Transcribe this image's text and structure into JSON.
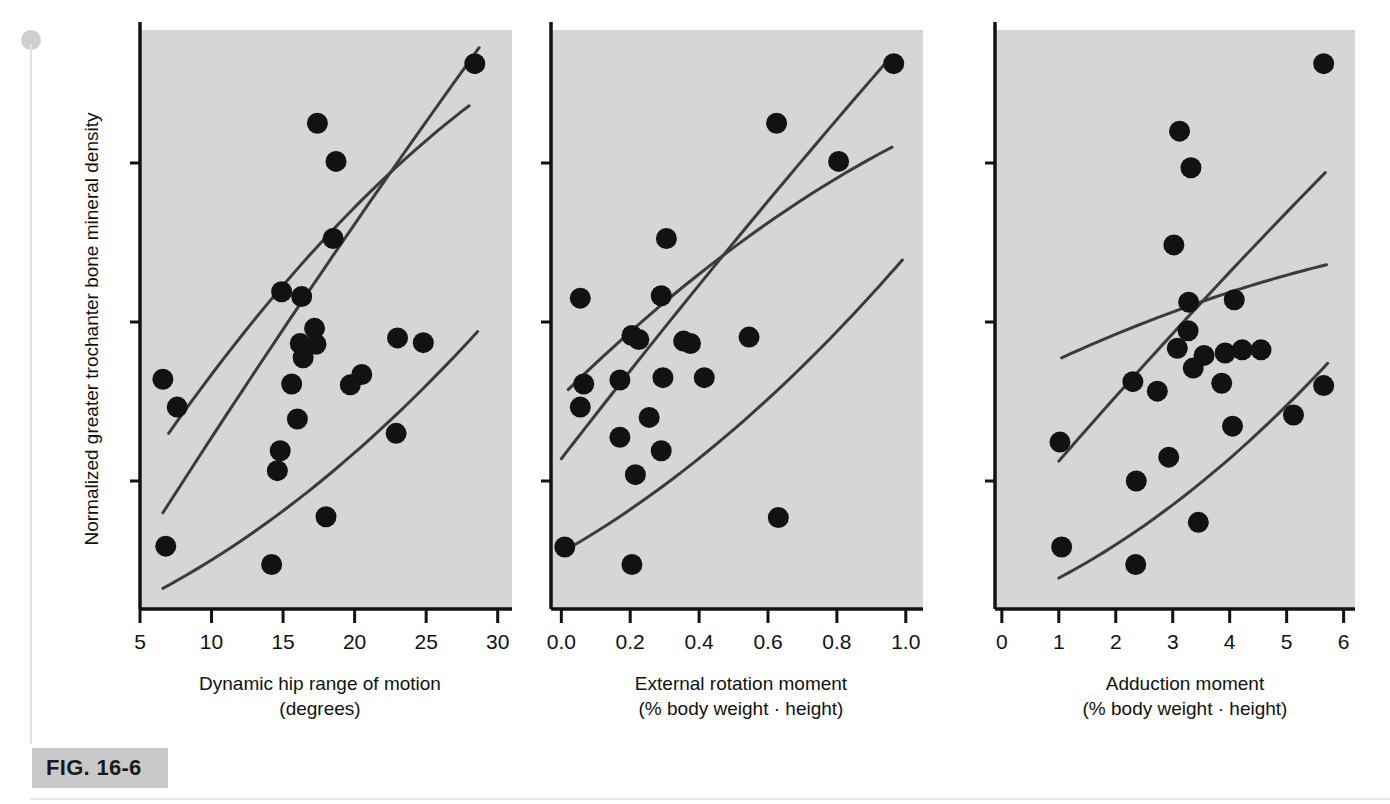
{
  "figure": {
    "id_label": "FIG. 16-6",
    "y_axis_label": "Normalized greater trochanter bone mineral density",
    "marker_color": "#121212",
    "line_color": "#3b3b3b",
    "plot_background": "#d6d6d6",
    "axis_color": "#121212",
    "chip_color": "#c9c9c9"
  },
  "chart_data": [
    {
      "type": "scatter",
      "panel": 1,
      "title": "",
      "xlabel": "Dynamic hip range of motion",
      "xlabel_units": "(degrees)",
      "ylabel": "Normalized greater trochanter bone mineral density",
      "xlim": [
        5,
        31
      ],
      "ylim": [
        -3.6,
        3.6
      ],
      "xticks": [
        5,
        10,
        15,
        20,
        25,
        30
      ],
      "xticklabels": [
        "5",
        "10",
        "15",
        "20",
        "25",
        "30"
      ],
      "yticks": [
        2,
        0,
        -2
      ],
      "yticklabels": [
        "2",
        "0",
        "-2"
      ],
      "grid": false,
      "legend": "none",
      "points": [
        {
          "x": 28.4,
          "y": 3.25
        },
        {
          "x": 17.4,
          "y": 2.5
        },
        {
          "x": 18.7,
          "y": 2.02
        },
        {
          "x": 18.5,
          "y": 1.05
        },
        {
          "x": 14.9,
          "y": 0.38
        },
        {
          "x": 16.3,
          "y": 0.32
        },
        {
          "x": 17.2,
          "y": -0.08
        },
        {
          "x": 16.2,
          "y": -0.27
        },
        {
          "x": 17.3,
          "y": -0.28
        },
        {
          "x": 16.4,
          "y": -0.45
        },
        {
          "x": 23.0,
          "y": -0.2
        },
        {
          "x": 24.8,
          "y": -0.26
        },
        {
          "x": 6.6,
          "y": -0.72
        },
        {
          "x": 15.6,
          "y": -0.78
        },
        {
          "x": 20.5,
          "y": -0.66
        },
        {
          "x": 19.7,
          "y": -0.79
        },
        {
          "x": 7.6,
          "y": -1.07
        },
        {
          "x": 16.0,
          "y": -1.22
        },
        {
          "x": 22.9,
          "y": -1.4
        },
        {
          "x": 14.8,
          "y": -1.62
        },
        {
          "x": 14.6,
          "y": -1.87
        },
        {
          "x": 18.0,
          "y": -2.45
        },
        {
          "x": 6.8,
          "y": -2.82
        },
        {
          "x": 14.2,
          "y": -3.05
        }
      ],
      "fit_line": {
        "x": [
          6.6,
          28.7
        ],
        "y": [
          -2.4,
          3.45
        ]
      },
      "upper_band": {
        "x": [
          7.0,
          28.0
        ],
        "y": [
          -1.4,
          2.72
        ]
      },
      "lower_band": {
        "x": [
          6.6,
          28.6
        ],
        "y": [
          -3.35,
          -0.12
        ]
      }
    },
    {
      "type": "scatter",
      "panel": 2,
      "title": "",
      "xlabel": "External rotation moment",
      "xlabel_units": "(% body weight · height)",
      "ylabel": "Normalized greater trochanter bone mineral density",
      "xlim": [
        -0.03,
        1.05
      ],
      "ylim": [
        -3.6,
        3.6
      ],
      "xticks": [
        0.0,
        0.2,
        0.4,
        0.6,
        0.8,
        1.0
      ],
      "xticklabels": [
        "0.0",
        "0.2",
        "0.4",
        "0.6",
        "0.8",
        "1.0"
      ],
      "yticks": [
        2,
        0,
        -2
      ],
      "yticklabels": [
        "2",
        "0",
        "-2"
      ],
      "grid": false,
      "legend": "none",
      "points": [
        {
          "x": 0.965,
          "y": 3.25
        },
        {
          "x": 0.625,
          "y": 2.5
        },
        {
          "x": 0.805,
          "y": 2.02
        },
        {
          "x": 0.305,
          "y": 1.05
        },
        {
          "x": 0.055,
          "y": 0.3
        },
        {
          "x": 0.29,
          "y": 0.33
        },
        {
          "x": 0.205,
          "y": -0.17
        },
        {
          "x": 0.225,
          "y": -0.22
        },
        {
          "x": 0.355,
          "y": -0.24
        },
        {
          "x": 0.375,
          "y": -0.27
        },
        {
          "x": 0.545,
          "y": -0.19
        },
        {
          "x": 0.065,
          "y": -0.78
        },
        {
          "x": 0.17,
          "y": -0.73
        },
        {
          "x": 0.295,
          "y": -0.7
        },
        {
          "x": 0.415,
          "y": -0.7
        },
        {
          "x": 0.055,
          "y": -1.07
        },
        {
          "x": 0.255,
          "y": -1.2
        },
        {
          "x": 0.17,
          "y": -1.45
        },
        {
          "x": 0.29,
          "y": -1.62
        },
        {
          "x": 0.215,
          "y": -1.92
        },
        {
          "x": 0.01,
          "y": -2.83
        },
        {
          "x": 0.63,
          "y": -2.46
        },
        {
          "x": 0.205,
          "y": -3.05
        }
      ],
      "fit_line": {
        "x": [
          0.0,
          0.96
        ],
        "y": [
          -1.72,
          3.35
        ]
      },
      "upper_band": {
        "x": [
          0.02,
          0.96
        ],
        "y": [
          -0.85,
          2.2
        ]
      },
      "lower_band": {
        "x": [
          0.0,
          0.99
        ],
        "y": [
          -2.9,
          0.78
        ]
      }
    },
    {
      "type": "scatter",
      "panel": 3,
      "title": "",
      "xlabel": "Adduction moment",
      "xlabel_units": "(% body weight · height)",
      "ylabel": "Normalized greater trochanter bone mineral density",
      "xlim": [
        -0.12,
        6.2
      ],
      "ylim": [
        -3.6,
        3.6
      ],
      "xticks": [
        0,
        1,
        2,
        3,
        4,
        5,
        6
      ],
      "xticklabels": [
        "0",
        "1",
        "2",
        "3",
        "4",
        "5",
        "6"
      ],
      "yticks": [
        2,
        0,
        -2
      ],
      "yticklabels": [
        "2",
        "0",
        "-2"
      ],
      "grid": false,
      "legend": "none",
      "points": [
        {
          "x": 5.65,
          "y": 3.25
        },
        {
          "x": 3.12,
          "y": 2.4
        },
        {
          "x": 3.32,
          "y": 1.94
        },
        {
          "x": 3.02,
          "y": 0.97
        },
        {
          "x": 3.28,
          "y": 0.25
        },
        {
          "x": 4.08,
          "y": 0.28
        },
        {
          "x": 3.27,
          "y": -0.11
        },
        {
          "x": 3.08,
          "y": -0.33
        },
        {
          "x": 3.55,
          "y": -0.42
        },
        {
          "x": 3.92,
          "y": -0.39
        },
        {
          "x": 4.22,
          "y": -0.35
        },
        {
          "x": 4.55,
          "y": -0.35
        },
        {
          "x": 3.36,
          "y": -0.58
        },
        {
          "x": 2.3,
          "y": -0.75
        },
        {
          "x": 2.73,
          "y": -0.87
        },
        {
          "x": 3.86,
          "y": -0.77
        },
        {
          "x": 5.65,
          "y": -0.8
        },
        {
          "x": 4.05,
          "y": -1.31
        },
        {
          "x": 5.12,
          "y": -1.17
        },
        {
          "x": 1.02,
          "y": -1.51
        },
        {
          "x": 2.93,
          "y": -1.7
        },
        {
          "x": 2.36,
          "y": -2.0
        },
        {
          "x": 3.45,
          "y": -2.52
        },
        {
          "x": 1.05,
          "y": -2.83
        },
        {
          "x": 2.35,
          "y": -3.05
        }
      ],
      "fit_line": {
        "x": [
          1.0,
          5.68
        ],
        "y": [
          -1.75,
          1.88
        ]
      },
      "upper_band": {
        "x": [
          1.05,
          5.7
        ],
        "y": [
          -0.45,
          0.72
        ]
      },
      "lower_band": {
        "x": [
          1.0,
          5.72
        ],
        "y": [
          -3.22,
          -0.52
        ]
      }
    }
  ]
}
